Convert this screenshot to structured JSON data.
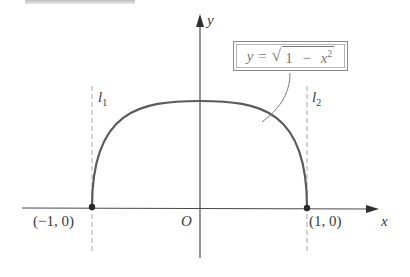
{
  "figure": {
    "title_fragment": "",
    "equation": {
      "lhs": "y",
      "equals": "=",
      "radical_sign": "√",
      "radicand_one": "1",
      "minus": "−",
      "radicand_var": "x",
      "radicand_exp": "2"
    },
    "axes": {
      "x_label": "x",
      "y_label": "y",
      "origin_label": "O"
    },
    "points": [
      {
        "label": "(−1, 0)",
        "x": -1,
        "y": 0
      },
      {
        "label": "(1, 0)",
        "x": 1,
        "y": 0
      }
    ],
    "lines": [
      {
        "name": "l",
        "subscript": "1",
        "x": -1,
        "style": "dashed"
      },
      {
        "name": "l",
        "subscript": "2",
        "x": 1,
        "style": "dashed"
      }
    ],
    "curve": {
      "description": "upper semicircle",
      "domain": [
        -1,
        1
      ],
      "range": [
        0,
        1
      ],
      "color": "#5a5a5a"
    },
    "colors": {
      "axis": "#4a4a4a",
      "dashed": "#a8a8a8",
      "label": "#3a3a3a"
    }
  }
}
